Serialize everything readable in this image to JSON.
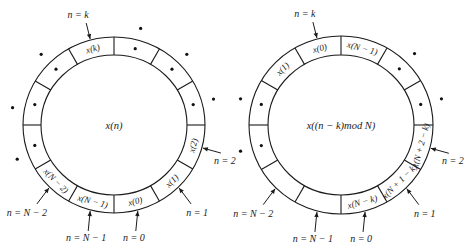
{
  "figure": {
    "width": 472,
    "height": 251,
    "segments": 12,
    "stroke_color": "#1a1a1a"
  },
  "left_ring": {
    "cx": 114,
    "cy": 125,
    "rx_outer": 91,
    "ry_outer": 88,
    "rx_inner": 73,
    "ry_inner": 70,
    "center_label": "x(n)",
    "cells": [
      {
        "angle_start": 90,
        "label": "x(k)"
      },
      {
        "angle_start": 270,
        "label": "x(0)"
      },
      {
        "angle_start": 300,
        "label": "x(1)"
      },
      {
        "angle_start": 330,
        "label": "x(2)"
      },
      {
        "angle_start": 240,
        "label": "x(N − 1)"
      },
      {
        "angle_start": 210,
        "label": "x(N − 2)"
      }
    ],
    "inner_dots_angles": [
      120,
      150,
      180,
      60,
      30,
      0
    ],
    "outer_dots_angles": [
      135,
      170,
      200,
      75,
      45,
      15
    ],
    "pointers": [
      {
        "label": "n = k",
        "angle": 105,
        "position": "top"
      },
      {
        "label": "n = 2",
        "angle": 345,
        "position": "right"
      },
      {
        "label": "n = 1",
        "angle": 315,
        "position": "lower-right"
      },
      {
        "label": "n = 0",
        "angle": 285,
        "position": "bottom"
      },
      {
        "label": "n = N − 1",
        "angle": 255,
        "position": "bottom"
      },
      {
        "label": "n = N − 2",
        "angle": 225,
        "position": "lower-left"
      }
    ]
  },
  "right_ring": {
    "cx": 341,
    "cy": 125,
    "rx_outer": 92,
    "ry_outer": 89,
    "rx_inner": 73,
    "ry_inner": 70,
    "center_label": "x((n − k)mod N)",
    "cells": [
      {
        "angle_start": 90,
        "label": "x(0)"
      },
      {
        "angle_start": 60,
        "label": "x(N − 1)"
      },
      {
        "angle_start": 120,
        "label": "x(1)"
      },
      {
        "angle_start": 270,
        "label": "x(N − k)"
      },
      {
        "angle_start": 300,
        "label": "x(N + 1 − k)"
      },
      {
        "angle_start": 330,
        "label": "x(N + 2 − k)"
      }
    ],
    "inner_dots_angles": [
      150,
      180,
      30,
      0
    ],
    "outer_dots_angles": [
      165,
      195,
      45,
      15
    ],
    "pointers": [
      {
        "label": "n = k",
        "angle": 105,
        "position": "top"
      },
      {
        "label": "n = 2",
        "angle": 345,
        "position": "right"
      },
      {
        "label": "n = 1",
        "angle": 315,
        "position": "lower-right"
      },
      {
        "label": "n = 0",
        "angle": 285,
        "position": "bottom"
      },
      {
        "label": "n = N − 1",
        "angle": 255,
        "position": "bottom"
      },
      {
        "label": "n = N − 2",
        "angle": 225,
        "position": "lower-left"
      }
    ]
  }
}
